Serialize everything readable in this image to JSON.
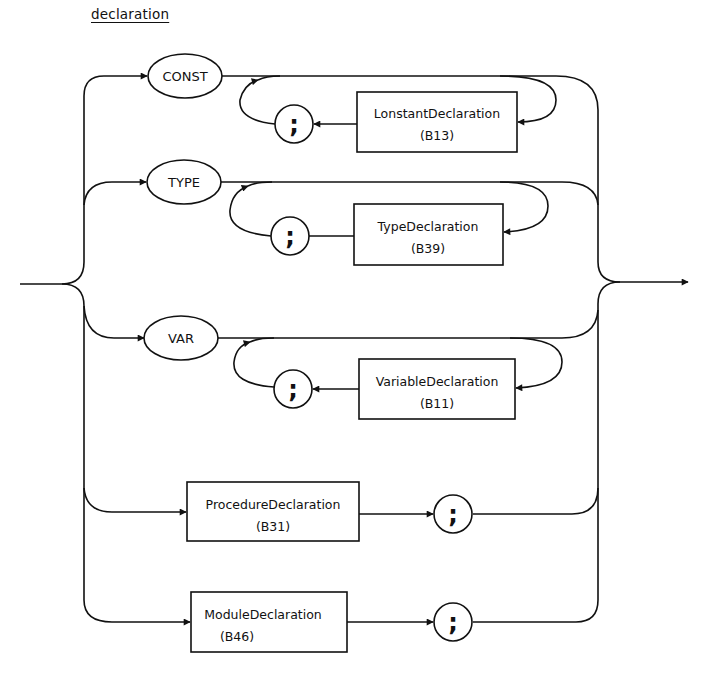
{
  "title": "declaration",
  "colors": {
    "ink": "#111111",
    "background": "#ffffff"
  },
  "branches": [
    {
      "keyword": "CONST",
      "loop_box": {
        "name": "LonstantDeclaration",
        "ref": "(B13)"
      },
      "separator": ";"
    },
    {
      "keyword": "TYPE",
      "loop_box": {
        "name": "TypeDeclaration",
        "ref": "(B39)"
      },
      "separator": ";"
    },
    {
      "keyword": "VAR",
      "loop_box": {
        "name": "VariableDeclaration",
        "ref": "(B11)"
      },
      "separator": ";"
    },
    {
      "box": {
        "name": "ProcedureDeclaration",
        "ref": "(B31)"
      },
      "terminator": ";"
    },
    {
      "box": {
        "name": "ModuleDeclaration",
        "ref": "(B46)"
      },
      "terminator": ";"
    }
  ]
}
